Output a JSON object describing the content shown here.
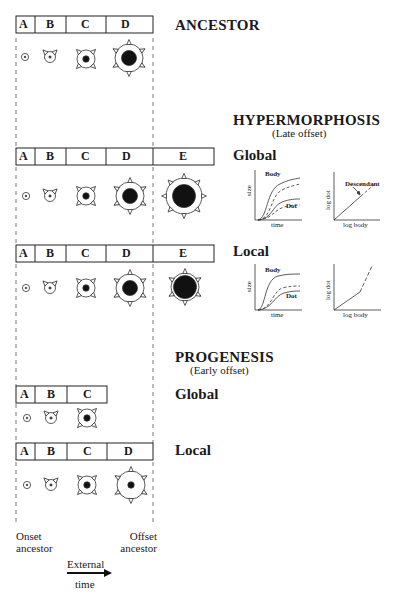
{
  "sections": {
    "ancestor": {
      "title": "ANCESTOR",
      "stages": [
        "A",
        "B",
        "C",
        "D"
      ]
    },
    "hypermorphosis": {
      "title": "HYPERMORPHOSIS",
      "subtitle": "(Late offset)",
      "global": {
        "label": "Global",
        "stages": [
          "A",
          "B",
          "C",
          "D",
          "E"
        ]
      },
      "local": {
        "label": "Local",
        "stages": [
          "A",
          "B",
          "C",
          "D",
          "E"
        ]
      }
    },
    "progenesis": {
      "title": "PROGENESIS",
      "subtitle": "(Early offset)",
      "global": {
        "label": "Global",
        "stages": [
          "A",
          "B",
          "C"
        ]
      },
      "local": {
        "label": "Local",
        "stages": [
          "A",
          "B",
          "C",
          "D"
        ]
      }
    }
  },
  "graphs": {
    "size_time": {
      "xlabel": "time",
      "ylabel": "size",
      "body_label": "Body",
      "dot_label": "Dot"
    },
    "allometry_global": {
      "xlabel": "log body",
      "ylabel": "log dot",
      "annotation": "Descendant"
    },
    "allometry_local": {
      "xlabel": "log body",
      "ylabel": "log dot"
    }
  },
  "footer": {
    "onset_line1": "Onset",
    "onset_line2": "ancestor",
    "offset_line1": "Offset",
    "offset_line2": "ancestor",
    "time_line1": "External",
    "time_line2": "time"
  }
}
